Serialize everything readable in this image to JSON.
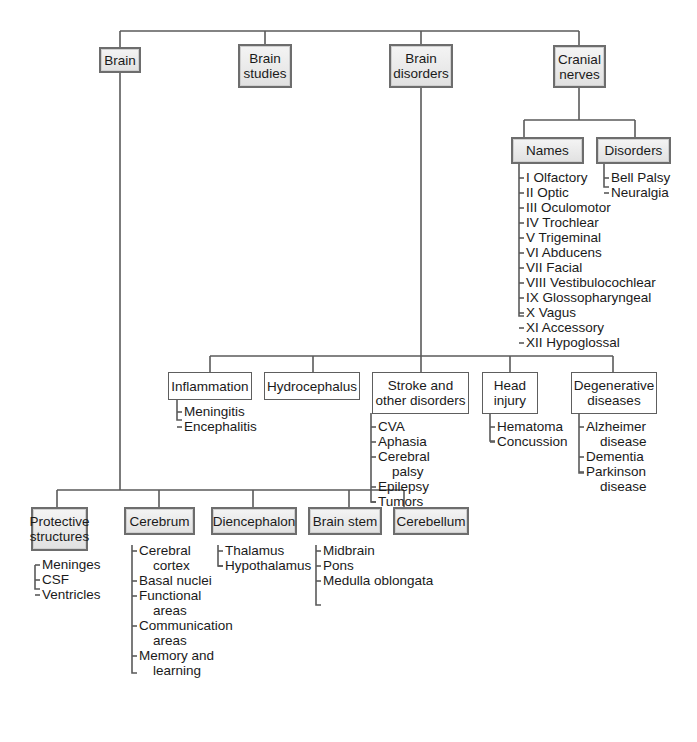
{
  "root": {
    "children": [
      {
        "id": "brain",
        "label": "Brain"
      },
      {
        "id": "brain_studies",
        "label": "Brain\nstudies"
      },
      {
        "id": "brain_disorders",
        "label": "Brain\ndisorders"
      },
      {
        "id": "cranial_nerves",
        "label": "Cranial\nnerves"
      }
    ]
  },
  "cranial_nerves": {
    "names": {
      "label": "Names",
      "items": [
        "I Olfactory",
        "II Optic",
        "III Oculomotor",
        "IV Trochlear",
        "V Trigeminal",
        "VI Abducens",
        "VII Facial",
        "VIII Vestibulocochlear",
        "IX Glossopharyngeal",
        "X Vagus",
        "XI Accessory",
        "XII Hypoglossal"
      ]
    },
    "disorders": {
      "label": "Disorders",
      "items": [
        "Bell Palsy",
        "Neuralgia"
      ]
    }
  },
  "brain_disorders": {
    "inflammation": {
      "label": "Inflammation",
      "items": [
        "Meningitis",
        "Encephalitis"
      ]
    },
    "hydrocephalus": {
      "label": "Hydrocephalus",
      "items": []
    },
    "stroke": {
      "label": "Stroke and\nother disorders",
      "items": [
        "CVA",
        "Aphasia",
        "Cerebral\npalsy",
        "Epilepsy",
        "Tumors"
      ]
    },
    "head_injury": {
      "label": "Head\ninjury",
      "items": [
        "Hematoma",
        "Concussion"
      ]
    },
    "degenerative": {
      "label": "Degenerative\ndiseases",
      "items": [
        "Alzheimer\ndisease",
        "Dementia",
        "Parkinson\ndisease"
      ]
    }
  },
  "brain": {
    "protective": {
      "label": "Protective\nstructures",
      "items": [
        "Meninges",
        "CSF",
        "Ventricles"
      ]
    },
    "cerebrum": {
      "label": "Cerebrum",
      "items": [
        "Cerebral\ncortex",
        "Basal nuclei",
        "Functional\nareas",
        "Communication\nareas",
        "Memory and\nlearning"
      ]
    },
    "diencephalon": {
      "label": "Diencephalon",
      "items": [
        "Thalamus",
        "Hypothalamus"
      ]
    },
    "brain_stem": {
      "label": "Brain stem",
      "items": [
        "Midbrain",
        "Pons",
        "Medulla oblongata"
      ]
    },
    "cerebellum": {
      "label": "Cerebellum",
      "items": []
    }
  },
  "colors": {
    "line": "#5a5a5a",
    "box_border": "#6d6d6d",
    "box_fill_top": "#f4f4f4",
    "box_fill_bottom": "#e1e1e1"
  }
}
